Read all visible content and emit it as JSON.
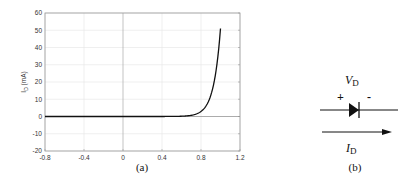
{
  "chart_data": {
    "type": "line",
    "title": "",
    "xlabel": "",
    "ylabel": "I_D (mA)",
    "ylabel_main": "I",
    "ylabel_sub": "D",
    "ylabel_unit": " (mA)",
    "xlim": [
      -0.8,
      1.2
    ],
    "ylim": [
      -20,
      60
    ],
    "xticks": [
      -0.8,
      -0.4,
      0,
      0.4,
      0.8,
      1.2
    ],
    "xtick_labels": [
      "-0.8",
      "-0.4",
      "0",
      "0.4",
      "0.8",
      "1.2"
    ],
    "yticks": [
      -20,
      -10,
      0,
      10,
      20,
      30,
      40,
      50,
      60
    ],
    "ytick_labels": [
      "-20",
      "-10",
      "0",
      "10",
      "20",
      "30",
      "40",
      "50",
      "60"
    ],
    "grid": true,
    "series": [
      {
        "name": "diode I-V",
        "x": [
          -0.8,
          -0.4,
          0,
          0.4,
          0.6,
          0.7,
          0.75,
          0.8,
          0.85,
          0.9,
          0.95,
          1.0
        ],
        "y": [
          0,
          0,
          0,
          0.02,
          0.2,
          0.8,
          1.8,
          4,
          8.5,
          16,
          30,
          51
        ]
      }
    ],
    "caption": "(a)"
  },
  "circuit": {
    "voltage_label_main": "V",
    "voltage_label_sub": "D",
    "plus": "+",
    "minus": "-",
    "current_label_main": "I",
    "current_label_sub": "D",
    "caption": "(b)"
  }
}
